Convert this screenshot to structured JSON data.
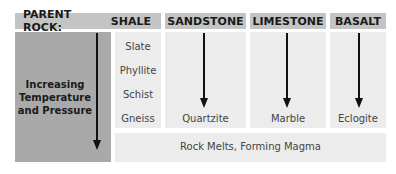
{
  "header": {
    "parent_rock_label": "PARENT ROCK:",
    "columns": [
      "SHALE",
      "SANDSTONE",
      "LIMESTONE",
      "BASALT"
    ]
  },
  "side_label": {
    "line1": "Increasing",
    "line2": "Temperature",
    "line3": "and Pressure"
  },
  "shale_sequence": [
    "Slate",
    "Phyllite",
    "Schist",
    "Gneiss"
  ],
  "products": {
    "sandstone": "Quartzite",
    "limestone": "Marble",
    "basalt": "Eclogite"
  },
  "bottom_bar": "Rock Melts, Forming Magma",
  "colors": {
    "header_bg": "#c4c4c4",
    "side_bg": "#a9a9a9",
    "cell_bg": "#ececec",
    "arrow": "#111111"
  }
}
